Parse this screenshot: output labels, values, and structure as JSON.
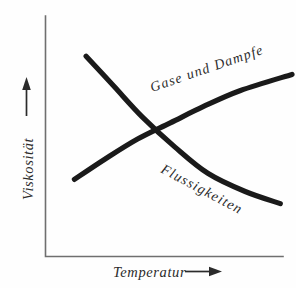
{
  "figure": {
    "background_color": "#fefefe",
    "ink_color": "#1a1a1a",
    "axis_color": "#6f6f6f"
  },
  "axes": {
    "y": {
      "label": "Viskosität",
      "arrow_icon": "arrow-up-icon",
      "direction": "up"
    },
    "x": {
      "label": "Temperatur",
      "arrow_icon": "arrow-right-icon",
      "direction": "right"
    }
  },
  "curves": [
    {
      "id": "gases",
      "label": "Gase und Dampfe",
      "trend": "increasing",
      "description": "viscosity of gases and vapours rises with temperature"
    },
    {
      "id": "liquids",
      "label": "Flussigkeiten",
      "trend": "decreasing",
      "description": "viscosity of liquids falls with temperature"
    }
  ],
  "chart_data": {
    "type": "line",
    "title": "",
    "xlabel": "Temperatur",
    "ylabel": "Viskosität",
    "xlim": [
      0,
      1
    ],
    "ylim": [
      0,
      1
    ],
    "grid": false,
    "legend": "inline-curve-labels",
    "annotations": [
      {
        "text": "Gase und Dampfe",
        "attached_to": "gases",
        "rotation_deg": -19
      },
      {
        "text": "Flussigkeiten",
        "attached_to": "liquids",
        "rotation_deg": 28
      }
    ],
    "series": [
      {
        "name": "Gase und Dampfe",
        "x": [
          0.07,
          0.2,
          0.34,
          0.48,
          0.62,
          0.78,
          1.0
        ],
        "y": [
          0.3,
          0.4,
          0.5,
          0.58,
          0.66,
          0.74,
          0.82
        ]
      },
      {
        "name": "Flussigkeiten",
        "x": [
          0.12,
          0.24,
          0.36,
          0.5,
          0.64,
          0.8,
          0.95
        ],
        "y": [
          0.91,
          0.76,
          0.61,
          0.46,
          0.33,
          0.24,
          0.18
        ]
      }
    ],
    "crossing_point": {
      "x": 0.36,
      "y": 0.54
    }
  }
}
